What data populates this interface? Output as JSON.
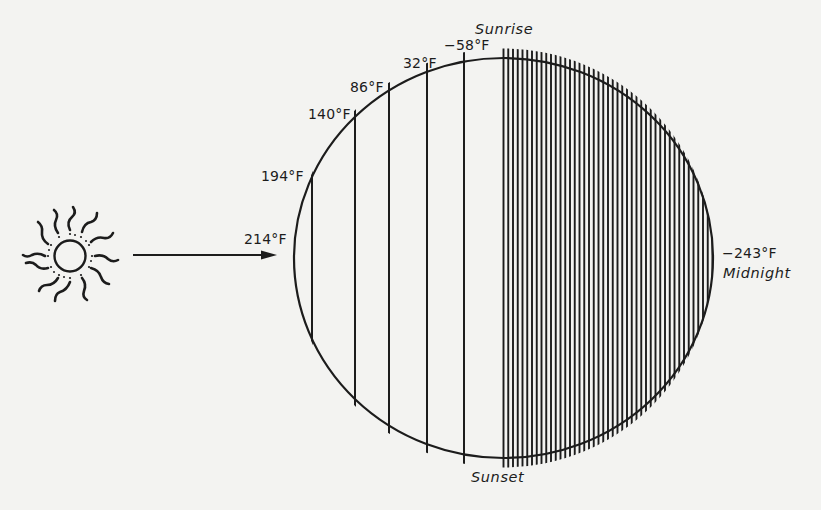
{
  "figure": {
    "sun": {
      "icon": "sun-icon"
    },
    "arrow": {
      "icon": "arrow-right-icon"
    },
    "time_labels": {
      "sunrise": "Sunrise",
      "sunset": "Sunset",
      "midnight": "Midnight"
    },
    "temperature_labels": [
      {
        "id": "t214",
        "text": "214°F"
      },
      {
        "id": "t194",
        "text": "194°F"
      },
      {
        "id": "t140",
        "text": "140°F"
      },
      {
        "id": "t86",
        "text": "86°F"
      },
      {
        "id": "t32",
        "text": "32°F"
      },
      {
        "id": "tm58",
        "text": "−58°F"
      },
      {
        "id": "tm243",
        "text": "−243°F"
      }
    ],
    "colors": {
      "background": "#f3f3f1",
      "ink": "#1c1c1c"
    }
  }
}
